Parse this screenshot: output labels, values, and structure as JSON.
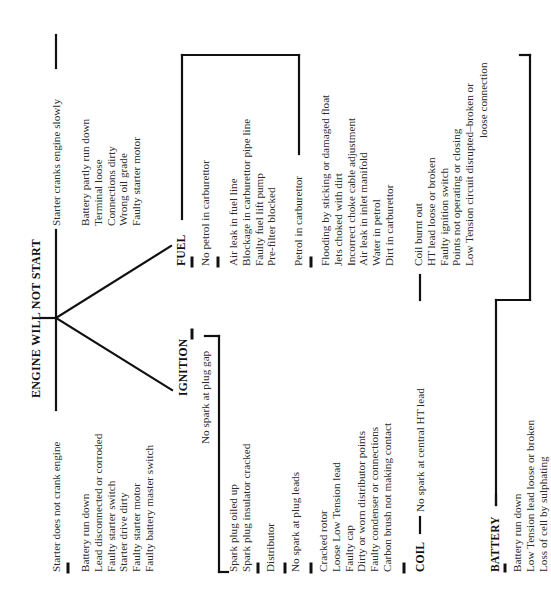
{
  "title": "ENGINE WILL NOT START",
  "starter_slow": {
    "label": "Starter cranks engine slowly",
    "causes": [
      "Battery partly run down",
      "Terminal loose",
      "Connections dirty",
      "Wrong oil grade",
      "Faulty starter motor"
    ]
  },
  "starter_no_crank": {
    "label": "Starter does not crank engine",
    "causes": [
      "Battery run down",
      "Lead disconnected or corroded",
      "Faulty starter switch",
      "Starter drive dirty",
      "Faulty starter motor",
      "Faulty battery master switch"
    ]
  },
  "fuel": {
    "label": "FUEL",
    "no_petrol": {
      "label": "No petrol in carburettor",
      "causes": [
        "Air leak in fuel line",
        "Blockage in carburettor pipe line",
        "Faulty fuel lift pump",
        "Pre-filter blocked"
      ]
    },
    "petrol": {
      "label": "Petrol in carburettor",
      "causes": [
        "Flooding by sticking or damaged float",
        "Jets choked with dirt",
        "Incorrect choke cable adjustment",
        "Air leak in inlet manifold",
        "Water in petrol",
        "Dirt in carburettor"
      ]
    }
  },
  "ignition": {
    "label": "IGNITION",
    "no_spark_gap": {
      "label": "No spark at plug gap",
      "causes": [
        "Spark plug oiled up",
        "Spark plug insulator cracked"
      ]
    },
    "distributor": "Distributor",
    "no_spark_leads": {
      "label": "No spark at plug leads",
      "causes": [
        "Cracked rotor",
        "Loose Low Tension lead",
        "Faulty cap",
        "Dirty or worn distributor points",
        "Faulty condenser or connections",
        "Carbon brush not making contact"
      ]
    }
  },
  "coil": {
    "label": "COIL",
    "no_spark_central": "No spark at central HT lead",
    "causes": [
      "Coil burnt out",
      "HT lead loose or broken",
      "Faulty ignition switch",
      "Points not operating or closing",
      "Low Tension circuit disrupted–broken or"
    ],
    "cause_continuation": "loose connection"
  },
  "battery": {
    "label": "BATTERY",
    "causes": [
      "Battery run down",
      "Low Tension lead loose or broken",
      "Loss of cell by sulphating"
    ]
  }
}
